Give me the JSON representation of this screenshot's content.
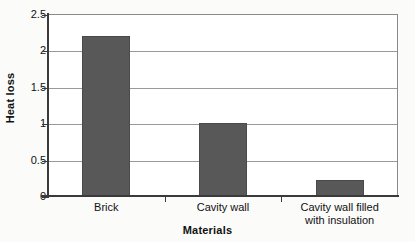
{
  "chart_data": {
    "type": "bar",
    "title": "",
    "xlabel": "Materials",
    "ylabel": "Heat loss",
    "categories": [
      "Brick",
      "Cavity wall",
      "Cavity wall filled with insulation"
    ],
    "category_lines": [
      [
        "Brick"
      ],
      [
        "Cavity wall"
      ],
      [
        "Cavity wall filled",
        "with insulation"
      ]
    ],
    "values": [
      2.2,
      1.0,
      0.22
    ],
    "ylim": [
      0,
      2.5
    ],
    "ytick_labels": [
      "0",
      "0.5",
      "1",
      "1.5",
      "2",
      "2.5"
    ],
    "ytick_values": [
      0,
      0.5,
      1,
      1.5,
      2,
      2.5
    ],
    "grid": true,
    "legend": "none",
    "colors": {
      "bar_fill": "#585858",
      "bar_edge": "#4a4a4a",
      "gridline": "#9a9a9a",
      "axis": "#3a3a3a",
      "text": "#111111",
      "plot_background": "#ffffff",
      "figure_background": "#fbfbfa"
    }
  }
}
